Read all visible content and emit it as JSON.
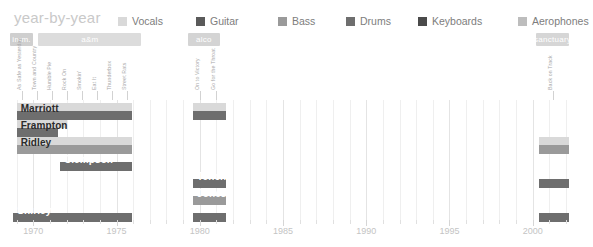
{
  "header": {
    "title": "year-by-year"
  },
  "legend": {
    "items": [
      {
        "label": "Vocals",
        "color": "#d9d9d9"
      },
      {
        "label": "Guitar",
        "color": "#5a5a5a"
      },
      {
        "label": "Bass",
        "color": "#9a9a9a"
      },
      {
        "label": "Drums",
        "color": "#6e6e6e"
      },
      {
        "label": "Keyboards",
        "color": "#4a4a4a"
      },
      {
        "label": "Aerophones",
        "color": "#bdbdbd"
      }
    ]
  },
  "eras": [
    {
      "label": "imm.",
      "start": 1968.6,
      "end": 1970.0,
      "color": "#cfcfcf"
    },
    {
      "label": "a&m",
      "start": 1970.3,
      "end": 1976.5,
      "color": "#dcdcdc"
    },
    {
      "label": "alco",
      "start": 1979.3,
      "end": 1981.2,
      "color": "#d4d4d4"
    },
    {
      "label": "sanctuary",
      "start": 2000.2,
      "end": 2002.2,
      "color": "#d6d6d6"
    }
  ],
  "albums": [
    {
      "label": "As Safe as Yesterday",
      "year": 1969.3
    },
    {
      "label": "Town and Country",
      "year": 1970.2
    },
    {
      "label": "Humble Pie",
      "year": 1971.1
    },
    {
      "label": "Rock On",
      "year": 1972.0
    },
    {
      "label": "Smokin'",
      "year": 1972.9
    },
    {
      "label": "Eat It",
      "year": 1973.8
    },
    {
      "label": "Thunderbox",
      "year": 1974.7
    },
    {
      "label": "Street Rats",
      "year": 1975.6
    },
    {
      "label": "On to Victory",
      "year": 1980.0
    },
    {
      "label": "Go for the Throat",
      "year": 1981.0
    },
    {
      "label": "Back on Track",
      "year": 2001.2
    }
  ],
  "members": [
    {
      "name": "Marriott",
      "name_color": "dark",
      "vocals": [
        {
          "start": 1969.0,
          "end": 1975.9
        },
        {
          "start": 1979.6,
          "end": 1981.6
        }
      ],
      "instrument": [
        {
          "start": 1969.0,
          "end": 1975.9,
          "color": "#6e6e6e"
        },
        {
          "start": 1979.6,
          "end": 1981.6,
          "color": "#6e6e6e"
        }
      ]
    },
    {
      "name": "Frampton",
      "name_color": "dark",
      "vocals": [
        {
          "start": 1969.0,
          "end": 1972.0
        }
      ],
      "instrument": [
        {
          "start": 1969.0,
          "end": 1971.5,
          "color": "#6e6e6e"
        }
      ]
    },
    {
      "name": "Ridley",
      "name_color": "dark",
      "vocals": [
        {
          "start": 1969.0,
          "end": 1975.9
        },
        {
          "start": 2000.4,
          "end": 2002.2
        }
      ],
      "instrument": [
        {
          "start": 1969.0,
          "end": 1975.9,
          "color": "#9a9a9a"
        },
        {
          "start": 2000.4,
          "end": 2002.2,
          "color": "#9a9a9a"
        }
      ]
    },
    {
      "name": "Clempson",
      "name_color": "light",
      "vocals": [],
      "instrument": [
        {
          "start": 1971.6,
          "end": 1975.9,
          "color": "#6e6e6e"
        }
      ]
    },
    {
      "name": "Tench",
      "name_color": "light",
      "vocals": [],
      "instrument": [
        {
          "start": 1979.6,
          "end": 1981.6,
          "color": "#6e6e6e"
        },
        {
          "start": 2000.4,
          "end": 2002.2,
          "color": "#6e6e6e"
        }
      ]
    },
    {
      "name": "Jones",
      "name_color": "light",
      "vocals": [],
      "instrument": [
        {
          "start": 1979.6,
          "end": 1981.6,
          "color": "#9a9a9a"
        }
      ]
    },
    {
      "name": "Shirley",
      "name_color": "light",
      "vocals": [],
      "instrument": [
        {
          "start": 1968.8,
          "end": 1975.9,
          "color": "#6e6e6e"
        },
        {
          "start": 1979.6,
          "end": 1981.6,
          "color": "#6e6e6e"
        },
        {
          "start": 2000.4,
          "end": 2002.2,
          "color": "#6e6e6e"
        }
      ]
    }
  ],
  "xaxis": {
    "min": 1968.3,
    "max": 2002.6,
    "tick_labels": [
      "1970",
      "1975",
      "1980",
      "1985",
      "1990",
      "1995",
      "2000"
    ],
    "tick_years": [
      1970,
      1975,
      1980,
      1985,
      1990,
      1995,
      2000
    ],
    "minor_step": 1
  },
  "chart_data": {
    "type": "bar",
    "title": "year-by-year",
    "xlabel": "",
    "ylabel": "",
    "xlim": [
      1968.3,
      2002.6
    ],
    "grid": true,
    "legend_position": "top-right",
    "categories": [
      "Marriott",
      "Frampton",
      "Ridley",
      "Clempson",
      "Tench",
      "Jones",
      "Shirley"
    ],
    "series": [
      {
        "name": "Marriott",
        "role": [
          "Vocals",
          "Drums"
        ],
        "spans": [
          [
            1969.0,
            1975.9
          ],
          [
            1979.6,
            1981.6
          ]
        ]
      },
      {
        "name": "Frampton",
        "role": [
          "Vocals",
          "Drums"
        ],
        "spans": [
          [
            1969.0,
            1972.0
          ]
        ]
      },
      {
        "name": "Ridley",
        "role": [
          "Vocals",
          "Bass"
        ],
        "spans": [
          [
            1969.0,
            1975.9
          ],
          [
            2000.4,
            2002.2
          ]
        ]
      },
      {
        "name": "Clempson",
        "role": [
          "Drums"
        ],
        "spans": [
          [
            1971.6,
            1975.9
          ]
        ]
      },
      {
        "name": "Tench",
        "role": [
          "Drums"
        ],
        "spans": [
          [
            1979.6,
            1981.6
          ],
          [
            2000.4,
            2002.2
          ]
        ]
      },
      {
        "name": "Jones",
        "role": [
          "Bass"
        ],
        "spans": [
          [
            1979.6,
            1981.6
          ]
        ]
      },
      {
        "name": "Shirley",
        "role": [
          "Drums"
        ],
        "spans": [
          [
            1968.8,
            1975.9
          ],
          [
            1979.6,
            1981.6
          ],
          [
            2000.4,
            2002.2
          ]
        ]
      }
    ],
    "eras": [
      {
        "label": "imm.",
        "span": [
          1968.6,
          1970.0
        ]
      },
      {
        "label": "a&m",
        "span": [
          1970.3,
          1976.5
        ]
      },
      {
        "label": "alco",
        "span": [
          1979.3,
          1981.2
        ]
      },
      {
        "label": "sanctuary",
        "span": [
          2000.2,
          2002.2
        ]
      }
    ],
    "albums": [
      {
        "label": "As Safe as Yesterday",
        "year": 1969.3
      },
      {
        "label": "Town and Country",
        "year": 1970.2
      },
      {
        "label": "Humble Pie",
        "year": 1971.1
      },
      {
        "label": "Rock On",
        "year": 1972.0
      },
      {
        "label": "Smokin'",
        "year": 1972.9
      },
      {
        "label": "Eat It",
        "year": 1973.8
      },
      {
        "label": "Thunderbox",
        "year": 1974.7
      },
      {
        "label": "Street Rats",
        "year": 1975.6
      },
      {
        "label": "On to Victory",
        "year": 1980.0
      },
      {
        "label": "Go for the Throat",
        "year": 1981.0
      },
      {
        "label": "Back on Track",
        "year": 2001.2
      }
    ]
  }
}
